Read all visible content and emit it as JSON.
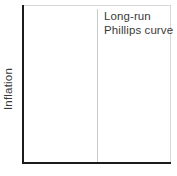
{
  "figure": {
    "background_color": "#ffffff",
    "axis_color": "#1b1b1b",
    "frame_color": "#d6d8da",
    "curve_color": "#c9cbcd",
    "text_color": "#3a3a3a"
  },
  "chart_data": {
    "type": "line",
    "title": "",
    "subtitle": "",
    "xlabel": "",
    "ylabel": "Inflation",
    "xticklabels": [],
    "yticklabels": [],
    "grid": false,
    "legend": false,
    "legend_position": "none",
    "annotations": [
      {
        "name": "long-run-phillips-curve-label",
        "lines": [
          "Long-run",
          "Phillips curve"
        ],
        "line1": "Long-run",
        "line2": "Phillips curve"
      }
    ],
    "series": [
      {
        "name": "Long-run Phillips curve",
        "kind": "vertical-line",
        "x": [
          0.5,
          0.5
        ],
        "y": [
          0,
          1
        ],
        "color": "#c9cbcd"
      }
    ]
  }
}
